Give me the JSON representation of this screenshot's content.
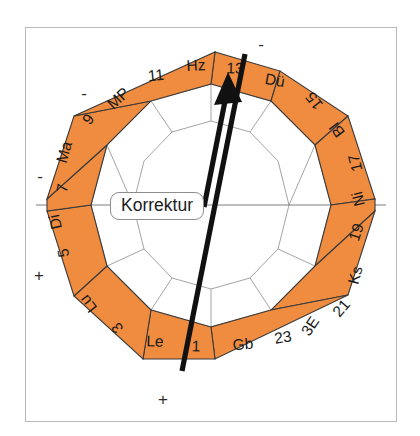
{
  "diagram": {
    "title": "Korrektur",
    "center_label": "Korrektur",
    "shape": "dodecagon-dial",
    "colors": {
      "segment_fill": "#f08c40",
      "segment_stroke": "#3a3a3a",
      "inner_stroke": "#9a9a9a",
      "arrow": "#111111",
      "frame": "#b8b8b8",
      "background": "#ffffff"
    },
    "segments": [
      {
        "index": 0,
        "number": "1",
        "code": "Le",
        "angle_deg": 180
      },
      {
        "index": 1,
        "number": "3",
        "code": "Lu",
        "angle_deg": 210
      },
      {
        "index": 2,
        "number": "5",
        "code": "Di",
        "angle_deg": 240
      },
      {
        "index": 3,
        "number": "7",
        "code": "Ma",
        "angle_deg": 270
      },
      {
        "index": 4,
        "number": "9",
        "code": "MP",
        "angle_deg": 300
      },
      {
        "index": 5,
        "number": "11",
        "code": "Hz",
        "angle_deg": 330
      },
      {
        "index": 6,
        "number": "13",
        "code": "Dü",
        "angle_deg": 0
      },
      {
        "index": 7,
        "number": "15",
        "code": "Bl",
        "angle_deg": 30
      },
      {
        "index": 8,
        "number": "17",
        "code": "Ni",
        "angle_deg": 60
      },
      {
        "index": 9,
        "number": "19",
        "code": "Ks",
        "angle_deg": 90
      },
      {
        "index": 10,
        "number": "21",
        "code": "3E",
        "angle_deg": 120
      },
      {
        "index": 11,
        "number": "23",
        "code": "Gb",
        "angle_deg": 150
      }
    ],
    "polarity_marks": [
      {
        "sign": "+",
        "position": "bottom",
        "near_segment": "1"
      },
      {
        "sign": "-",
        "position": "left",
        "near_segment": "7"
      },
      {
        "sign": "+",
        "position": "lower-left",
        "near_segment": "5"
      },
      {
        "sign": "-",
        "position": "upper-left",
        "near_segment": "9"
      },
      {
        "sign": "-",
        "position": "top",
        "near_segment": "13"
      }
    ],
    "arrow": {
      "name": "korrektur-arrow",
      "points_to_segment": "13",
      "points_to_code": "Dü",
      "from_segment": "1",
      "from_code": "Le"
    }
  }
}
